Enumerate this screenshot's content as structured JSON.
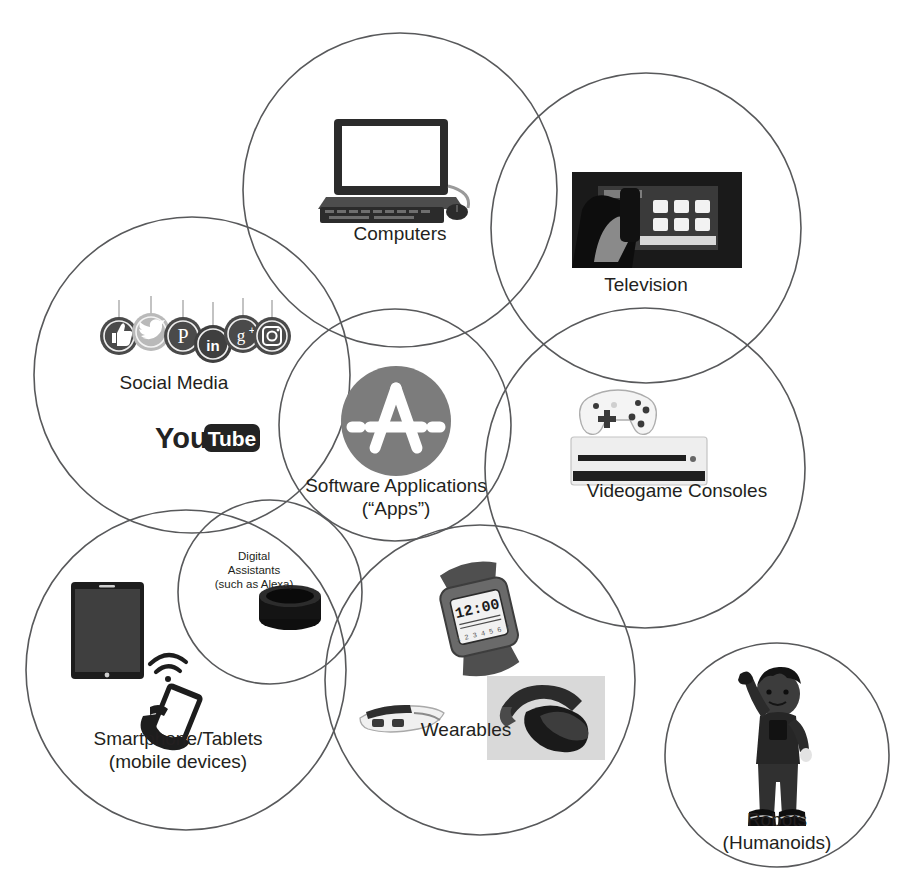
{
  "figure": {
    "type": "venn-diagram",
    "background_color": "#ffffff",
    "circle_stroke_color": "#58595b",
    "text_color": "#231f20",
    "accent_gray": "#808285"
  },
  "circles": [
    {
      "id": "computers",
      "label": "Computers",
      "cx": 400,
      "cy": 190,
      "r": 157,
      "label_x": 400,
      "label_y": 232,
      "label_size": "big"
    },
    {
      "id": "television",
      "label": "Television",
      "cx": 646,
      "cy": 228,
      "r": 155,
      "label_x": 646,
      "label_y": 283,
      "label_size": "big"
    },
    {
      "id": "social-media",
      "label": "Social Media",
      "cx": 192,
      "cy": 375,
      "r": 158,
      "label_x": 174,
      "label_y": 381,
      "label_size": "big"
    },
    {
      "id": "software-applications",
      "label": "Software Applications\n(“Apps”)",
      "cx": 395,
      "cy": 425,
      "r": 116,
      "label_x": 396,
      "label_y": 484,
      "label_size": "big"
    },
    {
      "id": "videogame-consoles",
      "label": "Videogame Consoles",
      "cx": 645,
      "cy": 468,
      "r": 160,
      "label_x": 677,
      "label_y": 489,
      "label_size": "big"
    },
    {
      "id": "digital-assistants",
      "label": "Digital\nAssistants\n(such as Alexa)",
      "cx": 270,
      "cy": 592,
      "r": 92,
      "label_x": 254,
      "label_y": 560,
      "label_size": "small"
    },
    {
      "id": "smartphone-tablets",
      "label": "Smartphone/Tablets\n(mobile devices)",
      "cx": 186,
      "cy": 670,
      "r": 160,
      "label_x": 178,
      "label_y": 737,
      "label_size": "big"
    },
    {
      "id": "wearables",
      "label": "Wearables",
      "cx": 480,
      "cy": 680,
      "r": 155,
      "label_x": 466,
      "label_y": 728,
      "label_size": "big"
    },
    {
      "id": "robots",
      "label": "Robots\n(Humanoids)",
      "cx": 777,
      "cy": 755,
      "r": 112,
      "label_x": 777,
      "label_y": 818,
      "label_size": "big"
    }
  ],
  "artwork": [
    {
      "id": "laptop-desktop-icon",
      "name": "laptop-keyboard-mouse-icon",
      "for": "computers"
    },
    {
      "id": "television-photo",
      "name": "tv-remote-photo",
      "for": "television"
    },
    {
      "id": "social-icons-row",
      "name": "social-media-icons",
      "for": "social-media"
    },
    {
      "id": "youtube-logo",
      "name": "youtube-logo",
      "for": "social-media"
    },
    {
      "id": "app-store-icon",
      "name": "app-store-a-icon",
      "for": "software-applications"
    },
    {
      "id": "xbox-console",
      "name": "game-console-and-controller",
      "for": "videogame-consoles"
    },
    {
      "id": "echo-dot",
      "name": "smart-speaker-puck",
      "for": "digital-assistants"
    },
    {
      "id": "tablet-device",
      "name": "tablet-device",
      "for": "smartphone-tablets"
    },
    {
      "id": "hand-phone-wifi",
      "name": "hand-holding-phone-wifi-icon",
      "for": "smartphone-tablets"
    },
    {
      "id": "smartwatch",
      "name": "smartwatch",
      "for": "wearables"
    },
    {
      "id": "smart-glasses",
      "name": "smart-glasses",
      "for": "wearables"
    },
    {
      "id": "vr-headset-photo",
      "name": "vr-headset-photo",
      "for": "wearables"
    },
    {
      "id": "humanoid-robot",
      "name": "humanoid-robot-figure",
      "for": "robots"
    }
  ],
  "social_icons": [
    {
      "id": "facebook",
      "glyph": "thumb-up-icon",
      "label": "Facebook"
    },
    {
      "id": "twitter",
      "glyph": "bird-icon",
      "label": "Twitter"
    },
    {
      "id": "pinterest",
      "glyph": "P",
      "label": "Pinterest"
    },
    {
      "id": "linkedin",
      "glyph": "in",
      "label": "LinkedIn"
    },
    {
      "id": "googleplus",
      "glyph": "g+",
      "label": "Google Plus"
    },
    {
      "id": "instagram",
      "glyph": "camera-icon",
      "label": "Instagram"
    }
  ],
  "youtube": {
    "word_you": "You",
    "word_tube": "Tube"
  },
  "smartwatch": {
    "time": "12:00",
    "subtext": "1 2 3 4 5 6 7"
  }
}
